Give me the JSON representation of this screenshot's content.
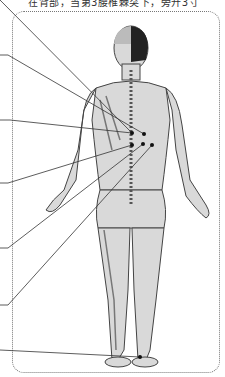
{
  "caption": {
    "text": "在背部，当第3腰椎棘突下，旁开3寸"
  },
  "figure": {
    "acupoints": [
      {
        "x": 132,
        "y": 133
      },
      {
        "x": 144,
        "y": 134
      },
      {
        "x": 132,
        "y": 145
      },
      {
        "x": 143,
        "y": 144
      },
      {
        "x": 152,
        "y": 145
      },
      {
        "x": 140,
        "y": 357
      }
    ],
    "leader_lines": [
      {
        "from": [
          0,
          0
        ],
        "to": [
          132,
          133
        ]
      },
      {
        "from": [
          0,
          55
        ],
        "to": [
          144,
          134
        ]
      },
      {
        "from": [
          0,
          120
        ],
        "to": [
          132,
          133
        ]
      },
      {
        "from": [
          0,
          183
        ],
        "to": [
          132,
          145
        ]
      },
      {
        "from": [
          0,
          248
        ],
        "to": [
          143,
          144
        ]
      },
      {
        "from": [
          0,
          305
        ],
        "to": [
          152,
          145
        ]
      },
      {
        "from": [
          0,
          350
        ],
        "to": [
          140,
          357
        ]
      }
    ],
    "colors": {
      "skin": "#d8d8d8",
      "outline": "#444444",
      "hair": "#222222",
      "line": "#333333"
    }
  }
}
